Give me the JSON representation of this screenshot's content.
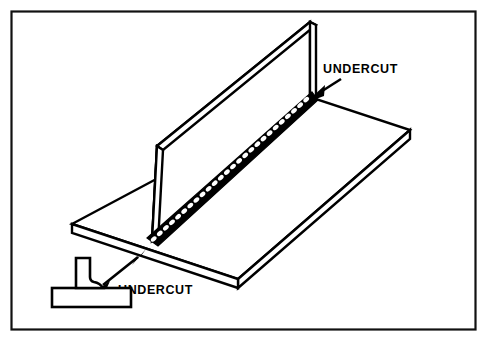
{
  "figure": {
    "title": "Undercut weld defect illustration",
    "background_color": "#ffffff",
    "line_color": "#000000",
    "frame": {
      "name": "outer-border",
      "stroke_color": "#111111",
      "x": 11,
      "y": 11,
      "width": 465,
      "height": 319
    }
  },
  "callouts": [
    {
      "id": "undercut-top",
      "label": "UNDERCUT",
      "text_x": 323,
      "text_y": 73,
      "leader": {
        "x1": 340,
        "y1": 79,
        "x2": 314,
        "y2": 96
      },
      "arrow_at": {
        "x": 311,
        "y": 98
      },
      "double_headed": false,
      "points_to": "weld-toe-at-top-of-vertical-plate"
    },
    {
      "id": "undercut-bottom",
      "label": "UNDERCUT",
      "text_x": 118,
      "text_y": 294,
      "leader": {
        "x1": 98,
        "y1": 288,
        "x2": 143,
        "y2": 253
      },
      "arrow_at": {
        "x": 95,
        "y": 291
      },
      "double_headed": true,
      "points_to": "cross-section-undercut-notch-and-joint-toe"
    }
  ],
  "geometry": {
    "vertical_plate": {
      "name": "vertical-plate",
      "top_far": {
        "x": 157,
        "y": 146
      },
      "top_near": {
        "x": 310,
        "y": 22
      },
      "bottom_near": {
        "x": 310,
        "y": 97
      },
      "bottom_far": {
        "x": 152,
        "y": 241
      },
      "thickness_px": 7
    },
    "base_plate": {
      "name": "horizontal-base-plate",
      "left_vertex": {
        "x": 72,
        "y": 224
      },
      "top_vertex": {
        "x": 310,
        "y": 97
      },
      "right_vertex": {
        "x": 410,
        "y": 130
      },
      "front_vertex": {
        "x": 238,
        "y": 279
      },
      "thickness_px": 9
    },
    "weld_bead": {
      "name": "fillet-weld-bead",
      "start": {
        "x": 310,
        "y": 97
      },
      "end": {
        "x": 152,
        "y": 241
      },
      "band_width_px": 11,
      "ripple_count": 26,
      "style": "stacked-dimes"
    },
    "detail_section": {
      "name": "t-joint-cross-section",
      "base_x": 52,
      "base_y": 288,
      "base_width": 79,
      "base_height": 20,
      "stem_x": 76,
      "stem_y": 258,
      "stem_width": 14,
      "undercut_side": "right"
    }
  }
}
